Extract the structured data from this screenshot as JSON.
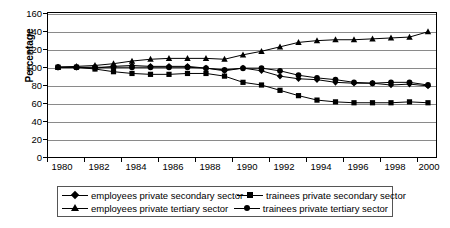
{
  "chart_data": {
    "type": "line",
    "title": "",
    "xlabel": "",
    "ylabel": "Percentage",
    "ylim": [
      0,
      160
    ],
    "ytick_step": 20,
    "yticks": [
      0,
      20,
      40,
      60,
      80,
      100,
      120,
      140,
      160
    ],
    "xticks": [
      1980,
      1982,
      1984,
      1986,
      1988,
      1990,
      1992,
      1994,
      1996,
      1998,
      2000
    ],
    "grid": "horizontal",
    "legend_position": "bottom",
    "x": [
      1980,
      1981,
      1982,
      1983,
      1984,
      1985,
      1986,
      1987,
      1988,
      1989,
      1990,
      1991,
      1992,
      1993,
      1994,
      1995,
      1996,
      1997,
      1998,
      1999,
      2000
    ],
    "series": [
      {
        "name": "employees private secondary sector",
        "marker": "diamond",
        "values": [
          100,
          100,
          99,
          101,
          102,
          101,
          101,
          101,
          99,
          96,
          99,
          96,
          90,
          87,
          86,
          83,
          82,
          82,
          80,
          81,
          79
        ]
      },
      {
        "name": "trainees private secondary sector",
        "marker": "square",
        "values": [
          100,
          100,
          98,
          95,
          93,
          92,
          92,
          93,
          93,
          90,
          83,
          80,
          74,
          68,
          63,
          61,
          60,
          60,
          60,
          61,
          60
        ]
      },
      {
        "name": "employees private tertiary sector",
        "marker": "triangle",
        "values": [
          100,
          101,
          102,
          104,
          107,
          109,
          110,
          110,
          110,
          109,
          114,
          118,
          123,
          128,
          130,
          131,
          131,
          132,
          133,
          134,
          140
        ]
      },
      {
        "name": "trainees private tertiary sector",
        "marker": "circle",
        "values": [
          100,
          100,
          100,
          100,
          100,
          100,
          100,
          100,
          99,
          97,
          99,
          99,
          96,
          91,
          88,
          86,
          83,
          82,
          83,
          83,
          80
        ]
      }
    ],
    "series_tail_note": ""
  },
  "axis": {
    "y_title": "Percentage",
    "y_ticks": [
      "160",
      "140",
      "120",
      "100",
      "80",
      "60",
      "40",
      "20",
      "0"
    ],
    "x_ticks": [
      "1980",
      "1982",
      "1984",
      "1986",
      "1988",
      "1990",
      "1992",
      "1994",
      "1996",
      "1998",
      "2000"
    ]
  },
  "legend": {
    "entries": [
      {
        "label": "employees private secondary sector",
        "marker": "diamond"
      },
      {
        "label": "trainees private secondary sector",
        "marker": "square"
      },
      {
        "label": "employees private tertiary sector",
        "marker": "triangle"
      },
      {
        "label": "trainees private tertiary sector",
        "marker": "circle"
      }
    ]
  },
  "colors": {
    "line": "#000000",
    "grid": "#8a8a8a",
    "frame": "#000000",
    "background": "#ffffff"
  }
}
